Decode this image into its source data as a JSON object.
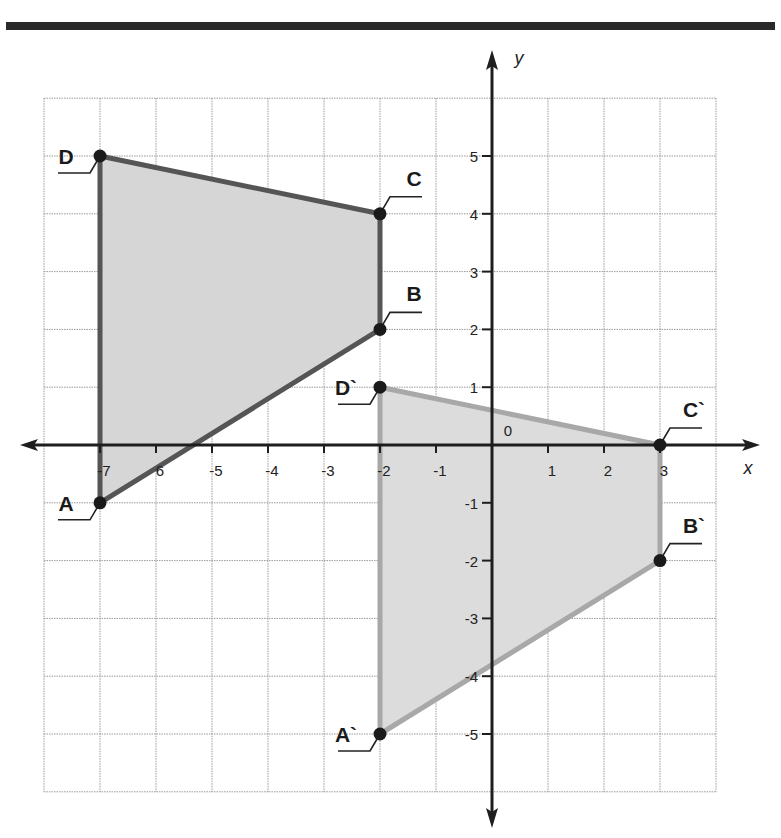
{
  "header": {
    "title": "",
    "rule_color": "#2a2a2a"
  },
  "chart_data": {
    "type": "scatter",
    "title": "",
    "xlabel": "x",
    "ylabel": "y",
    "xlim": [
      -8,
      4
    ],
    "ylim": [
      -6,
      6
    ],
    "grid": true,
    "origin_label": "0",
    "x_ticks": [
      -7,
      -6,
      -5,
      -4,
      -3,
      -2,
      -1,
      1,
      2,
      3
    ],
    "x_tick_labels": [
      "-7",
      "6",
      "-5",
      "-4",
      "-3",
      "-2",
      "-1",
      "1",
      "2",
      "3"
    ],
    "y_ticks": [
      5,
      4,
      3,
      2,
      1,
      -1,
      -2,
      -3,
      -4,
      -5
    ],
    "y_tick_labels": [
      "5",
      "4",
      "3",
      "2",
      "1",
      "-1",
      "-2",
      "-3",
      "-4",
      "-5"
    ],
    "series": [
      {
        "name": "ABCD",
        "closed": true,
        "stroke": "#555555",
        "fill": "#d6d6d6",
        "points": [
          {
            "label": "A",
            "x": -7,
            "y": -1
          },
          {
            "label": "B",
            "x": -2,
            "y": 2
          },
          {
            "label": "C",
            "x": -2,
            "y": 4
          },
          {
            "label": "D",
            "x": -7,
            "y": 5
          }
        ]
      },
      {
        "name": "A`B`C`D`",
        "closed": true,
        "stroke": "#a8a8a8",
        "fill": "#dcdcdc",
        "points": [
          {
            "label": "A`",
            "x": -2,
            "y": -5
          },
          {
            "label": "B`",
            "x": 3,
            "y": -2
          },
          {
            "label": "C`",
            "x": 3,
            "y": 0
          },
          {
            "label": "D`",
            "x": -2,
            "y": 1
          }
        ]
      }
    ],
    "colors": {
      "grid": "#9a9a9a",
      "axis": "#1e1e1e",
      "point": "#1a1a1a"
    }
  }
}
